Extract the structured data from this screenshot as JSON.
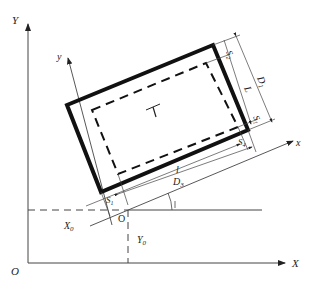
{
  "diagram": {
    "global_axes": {
      "x_label": "X",
      "y_label": "Y",
      "origin_label": "O"
    },
    "local_axes": {
      "x_label": "x",
      "y_label": "y",
      "origin_label": "O"
    },
    "offsets": {
      "x_offset": "X",
      "x_offset_sub": "0",
      "y_offset": "Y",
      "y_offset_sub": "0"
    },
    "dimensions": {
      "S1_left": {
        "main": "S",
        "sub": "1"
      },
      "S1_right": {
        "main": "S",
        "sub": "1"
      },
      "S2": {
        "main": "S",
        "sub": "2"
      },
      "S4": {
        "main": "S",
        "sub": "4"
      },
      "L": "L",
      "D1": {
        "main": "D",
        "sub": "1"
      },
      "l": "l",
      "D3": {
        "main": "D",
        "sub": "3"
      }
    },
    "center_mark": "T",
    "colors": {
      "line": "#222222",
      "thin": "#444444",
      "background": "#ffffff"
    }
  }
}
